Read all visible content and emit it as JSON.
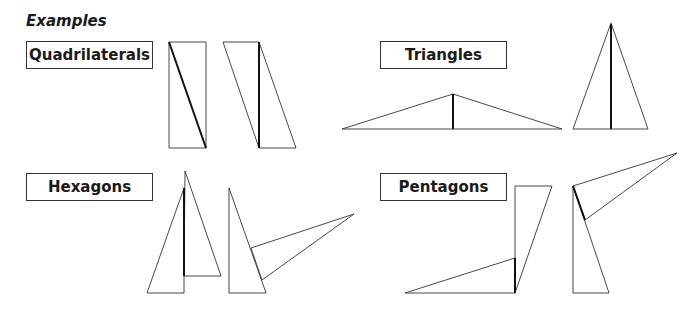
{
  "heading": "Examples",
  "groups": [
    {
      "label": "Quadrilaterals"
    },
    {
      "label": "Triangles"
    },
    {
      "label": "Hexagons"
    },
    {
      "label": "Pentagons"
    }
  ],
  "colors": {
    "line": "#333333",
    "thick_line": "#111111",
    "background": "#ffffff"
  }
}
